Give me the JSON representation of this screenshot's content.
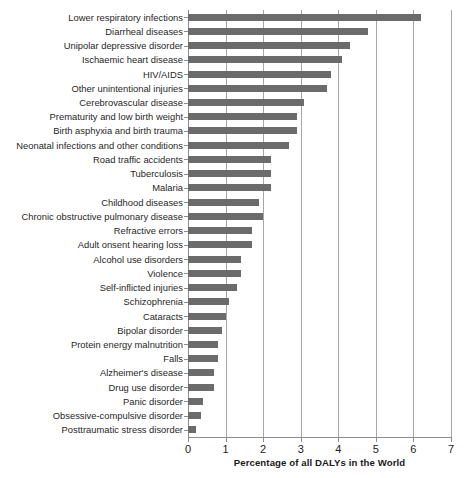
{
  "chart_data": {
    "type": "bar",
    "orientation": "horizontal",
    "title": "",
    "xlabel": "Percentage of all DALYs in the World",
    "ylabel": "",
    "xlim": [
      0,
      7
    ],
    "xticks": [
      0,
      1,
      2,
      3,
      4,
      5,
      6,
      7
    ],
    "xtick_labels": [
      "0",
      "1",
      "2",
      "3",
      "4",
      "5",
      "6",
      "7"
    ],
    "grid": "vertical",
    "legend": "none",
    "bar_color": "#6b6b6b",
    "gridline_color": "#a6a6a6",
    "categories": [
      "Lower respiratory infections",
      "Diarrheal diseases",
      "Unipolar depressive disorder",
      "Ischaemic heart disease",
      "HIV/AIDS",
      "Other unintentional injuries",
      "Cerebrovascular disease",
      "Prematurity and low birth weight",
      "Birth asphyxia and birth trauma",
      "Neonatal infections and other conditions",
      "Road traffic accidents",
      "Tuberculosis",
      "Malaria",
      "Childhood diseases",
      "Chronic obstructive pulmonary disease",
      "Refractive errors",
      "Adult onsent hearing loss",
      "Alcohol use disorders",
      "Violence",
      "Self-inflicted injuries",
      "Schizophrenia",
      "Cataracts",
      "Bipolar disorder",
      "Protein energy malnutrition",
      "Falls",
      "Alzheimer's disease",
      "Drug use disorder",
      "Panic disorder",
      "Obsessive-compulsive disorder",
      "Posttraumatic stress disorder"
    ],
    "values": [
      6.2,
      4.8,
      4.3,
      4.1,
      3.8,
      3.7,
      3.1,
      2.9,
      2.9,
      2.7,
      2.2,
      2.2,
      2.2,
      1.9,
      2.0,
      1.7,
      1.7,
      1.4,
      1.4,
      1.3,
      1.1,
      1.0,
      0.9,
      0.8,
      0.8,
      0.7,
      0.7,
      0.4,
      0.35,
      0.2
    ]
  }
}
